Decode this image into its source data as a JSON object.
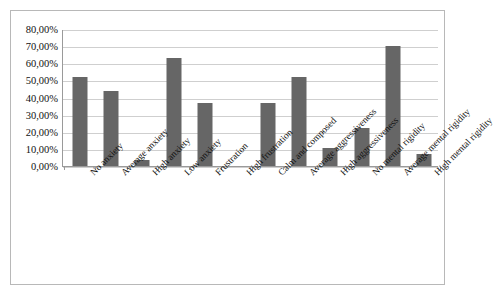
{
  "chart_data": {
    "type": "bar",
    "title": "",
    "subtitle": "",
    "xlabel": "",
    "ylabel": "",
    "ylim": [
      0,
      80
    ],
    "ytick_step": 10,
    "grid": true,
    "legend": "none",
    "value_suffix": "%",
    "decimal_separator": ",",
    "bar_color": "#666666",
    "gridline_color": "#cfcfcf",
    "axis_color": "#9a9a9a",
    "frame_color": "#b8b8b8",
    "ytick_labels": [
      "80,00%",
      "70,00%",
      "60,00%",
      "50,00%",
      "40,00%",
      "30,00%",
      "20,00%",
      "10,00%",
      "0,00%"
    ],
    "ytick_values": [
      80,
      70,
      60,
      50,
      40,
      30,
      20,
      10,
      0
    ],
    "categories": [
      "No anxiety",
      "Average anxiety",
      "High anxiety",
      "Low anxiety",
      "Frustration",
      "High frustration",
      "Calm and composed",
      "Average aggressiveness",
      "High aggressiveness",
      "No mental rigidity",
      "Average mental rigidity",
      "High mental rigidity"
    ],
    "values": [
      51.7,
      44.0,
      3.3,
      62.9,
      36.7,
      0.0,
      36.7,
      51.7,
      10.5,
      22.0,
      70.2,
      7.0
    ],
    "value_labels": [
      "51,70%",
      "44,00%",
      "3,30%",
      "62,90%",
      "36,70%",
      "0,00%",
      "36,70%",
      "51,70%",
      "10,50%",
      "22,00%",
      "70,20%",
      "7,00%"
    ]
  }
}
